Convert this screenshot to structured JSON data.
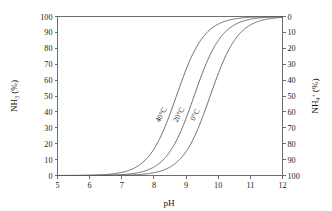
{
  "chart_data": {
    "type": "line",
    "title": "",
    "xlabel": "pH",
    "ylabel": "NH₃ (%)",
    "ylabel_right": "NH₄⁺ (%)",
    "xlim": [
      5,
      12
    ],
    "ylim": [
      0,
      100
    ],
    "ylim_right": [
      100,
      0
    ],
    "grid": false,
    "legend": "inline-curve-labels",
    "x_ticks": [
      "5",
      "6",
      "7",
      "8",
      "9",
      "10",
      "11",
      "12"
    ],
    "y_ticks_left": [
      "0",
      "10",
      "20",
      "30",
      "40",
      "50",
      "60",
      "70",
      "80",
      "90",
      "100"
    ],
    "y_ticks_right": [
      "0",
      "10",
      "20",
      "30",
      "40",
      "50",
      "60",
      "70",
      "80",
      "90",
      "100"
    ],
    "x": [
      5.0,
      5.25,
      5.5,
      5.75,
      6.0,
      6.25,
      6.5,
      6.75,
      7.0,
      7.25,
      7.5,
      7.75,
      8.0,
      8.25,
      8.5,
      8.75,
      9.0,
      9.25,
      9.5,
      9.75,
      10.0,
      10.25,
      10.5,
      10.75,
      11.0,
      11.25,
      11.5,
      11.75,
      12.0
    ],
    "series": [
      {
        "name": "40°C",
        "label": "40°C",
        "pKa": 8.7,
        "values": [
          0.02,
          0.04,
          0.06,
          0.11,
          0.2,
          0.35,
          0.63,
          1.11,
          1.96,
          3.43,
          5.93,
          10.07,
          16.63,
          26.01,
          38.04,
          51.42,
          64.5,
          75.67,
          84.3,
          90.4,
          94.4,
          96.8,
          98.2,
          99.0,
          99.4,
          99.7,
          99.8,
          99.9,
          99.95
        ]
      },
      {
        "name": "20°C",
        "label": "20°C",
        "pKa": 9.25,
        "values": [
          0.006,
          0.01,
          0.02,
          0.03,
          0.06,
          0.1,
          0.18,
          0.31,
          0.56,
          0.99,
          1.75,
          3.06,
          5.3,
          9.01,
          14.94,
          23.95,
          36.0,
          50.0,
          64.0,
          76.05,
          84.9,
          90.99,
          94.7,
          96.94,
          98.2,
          99.0,
          99.4,
          99.7,
          99.8
        ]
      },
      {
        "name": "0°C",
        "label": "0°C",
        "pKa": 9.75,
        "values": [
          0.002,
          0.003,
          0.006,
          0.01,
          0.02,
          0.03,
          0.06,
          0.1,
          0.18,
          0.31,
          0.56,
          0.99,
          1.75,
          3.06,
          5.3,
          9.01,
          14.94,
          23.95,
          36.0,
          50.0,
          64.0,
          76.05,
          84.9,
          90.99,
          94.7,
          96.94,
          98.2,
          99.0,
          99.4
        ]
      }
    ]
  }
}
